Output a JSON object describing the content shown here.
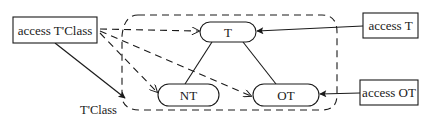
{
  "diagram": {
    "nodes": {
      "access_tclass": {
        "label": "access T'Class"
      },
      "access_t": {
        "label": "access T"
      },
      "access_ot": {
        "label": "access OT"
      },
      "t": {
        "label": "T"
      },
      "nt": {
        "label": "NT"
      },
      "ot": {
        "label": "OT"
      }
    },
    "labels": {
      "tclass": "T'Class"
    },
    "colors": {
      "stroke": "#1a1a1a",
      "background": "#ffffff"
    }
  }
}
